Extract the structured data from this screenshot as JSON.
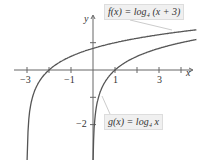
{
  "chart_data": {
    "type": "line",
    "title": "",
    "xlabel": "x",
    "ylabel": "y",
    "xlim": [
      -3.6,
      4.7
    ],
    "ylim": [
      -3.5,
      2.6
    ],
    "x_ticks": [
      -3,
      -1,
      1,
      3
    ],
    "x_tick_labels": [
      "−3",
      "−1",
      "1",
      "3"
    ],
    "y_ticks": [
      1,
      -2
    ],
    "y_tick_labels": [
      "",
      "−2"
    ],
    "grid": false,
    "series": [
      {
        "name": "f(x) = log4 (x + 3)",
        "label": "f(x) = log₄ (x + 3)",
        "x": [
          -2.98,
          -2.5,
          -2,
          -1,
          0,
          1,
          2,
          3,
          4.7
        ],
        "values": [
          -2.8,
          -0.5,
          0,
          0.5,
          0.79,
          1,
          1.16,
          1.29,
          1.47
        ]
      },
      {
        "name": "g(x) = log4 x",
        "label": "g(x) = log₄ x",
        "x": [
          0.02,
          0.25,
          0.5,
          1,
          2,
          3,
          4,
          4.7
        ],
        "values": [
          -2.8,
          -1,
          -0.5,
          0,
          0.5,
          0.79,
          1,
          1.12
        ]
      }
    ],
    "annotations": [
      "f(x) = log₄ (x + 3)",
      "g(x) = log₄ x"
    ]
  },
  "labels": {
    "x_axis": "x",
    "y_axis": "y",
    "xt": [
      "−3",
      "−1",
      "1",
      "3"
    ],
    "yt_neg2": "−2",
    "f_label": "f(x) = log₄ (x + 3)",
    "g_label": "g(x) = log₄ x"
  }
}
